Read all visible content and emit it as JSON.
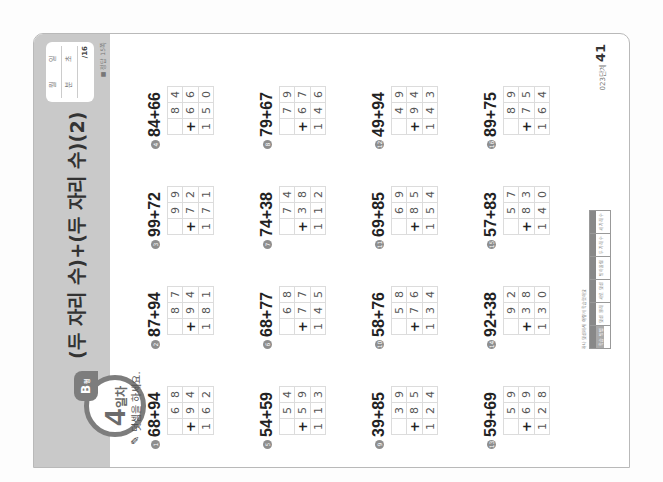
{
  "header": {
    "day_number": "4",
    "day_unit": "일차",
    "level_tab": "B",
    "level_tab_sub": "형",
    "title": "(두 자리 수)+(두 자리 수)(2)",
    "date_box": {
      "month_label": "월",
      "day_label": "일",
      "minute_label": "분",
      "second_label": "초",
      "score": "/16"
    },
    "answer_ref": "■ 정답 15쪽"
  },
  "instruction": "덧셈을 하세요.",
  "problems": [
    {
      "num": "1",
      "expr": "68+94",
      "a": [
        "",
        "6",
        "8"
      ],
      "b": [
        "+",
        "9",
        "4"
      ],
      "sum": [
        "1",
        "6",
        "2"
      ]
    },
    {
      "num": "2",
      "expr": "87+94",
      "a": [
        "",
        "8",
        "7"
      ],
      "b": [
        "+",
        "9",
        "4"
      ],
      "sum": [
        "1",
        "8",
        "1"
      ]
    },
    {
      "num": "3",
      "expr": "99+72",
      "a": [
        "",
        "9",
        "9"
      ],
      "b": [
        "+",
        "7",
        "2"
      ],
      "sum": [
        "1",
        "7",
        "1"
      ]
    },
    {
      "num": "4",
      "expr": "84+66",
      "a": [
        "",
        "8",
        "4"
      ],
      "b": [
        "+",
        "6",
        "6"
      ],
      "sum": [
        "1",
        "5",
        "0"
      ]
    },
    {
      "num": "5",
      "expr": "54+59",
      "a": [
        "",
        "5",
        "4"
      ],
      "b": [
        "+",
        "5",
        "9"
      ],
      "sum": [
        "1",
        "1",
        "3"
      ]
    },
    {
      "num": "6",
      "expr": "68+77",
      "a": [
        "",
        "6",
        "8"
      ],
      "b": [
        "+",
        "7",
        "7"
      ],
      "sum": [
        "1",
        "4",
        "5"
      ]
    },
    {
      "num": "7",
      "expr": "74+38",
      "a": [
        "",
        "7",
        "4"
      ],
      "b": [
        "+",
        "3",
        "8"
      ],
      "sum": [
        "1",
        "1",
        "2"
      ]
    },
    {
      "num": "8",
      "expr": "79+67",
      "a": [
        "",
        "7",
        "9"
      ],
      "b": [
        "+",
        "6",
        "7"
      ],
      "sum": [
        "1",
        "4",
        "6"
      ]
    },
    {
      "num": "9",
      "expr": "39+85",
      "a": [
        "",
        "3",
        "9"
      ],
      "b": [
        "+",
        "8",
        "5"
      ],
      "sum": [
        "1",
        "2",
        "4"
      ]
    },
    {
      "num": "10",
      "expr": "58+76",
      "a": [
        "",
        "5",
        "8"
      ],
      "b": [
        "+",
        "7",
        "6"
      ],
      "sum": [
        "1",
        "3",
        "4"
      ]
    },
    {
      "num": "11",
      "expr": "69+85",
      "a": [
        "",
        "6",
        "9"
      ],
      "b": [
        "+",
        "8",
        "5"
      ],
      "sum": [
        "1",
        "5",
        "4"
      ]
    },
    {
      "num": "12",
      "expr": "49+94",
      "a": [
        "",
        "4",
        "9"
      ],
      "b": [
        "+",
        "9",
        "4"
      ],
      "sum": [
        "1",
        "4",
        "3"
      ]
    },
    {
      "num": "13",
      "expr": "59+69",
      "a": [
        "",
        "5",
        "9"
      ],
      "b": [
        "+",
        "6",
        "9"
      ],
      "sum": [
        "1",
        "2",
        "8"
      ]
    },
    {
      "num": "14",
      "expr": "92+38",
      "a": [
        "",
        "9",
        "2"
      ],
      "b": [
        "+",
        "3",
        "8"
      ],
      "sum": [
        "1",
        "3",
        "0"
      ]
    },
    {
      "num": "15",
      "expr": "57+83",
      "a": [
        "",
        "5",
        "7"
      ],
      "b": [
        "+",
        "8",
        "3"
      ],
      "sum": [
        "1",
        "4",
        "0"
      ]
    },
    {
      "num": "16",
      "expr": "89+75",
      "a": [
        "",
        "8",
        "9"
      ],
      "b": [
        "+",
        "7",
        "5"
      ],
      "sum": [
        "1",
        "6",
        "4"
      ]
    }
  ],
  "footer": {
    "progress_label": "하나 덧셈에서 이렇게 학습했어요",
    "progress_steps": [
      "덧셈 원리",
      "세로 덧셈",
      "받아올림",
      "두 자리 수",
      "세 자리 수"
    ],
    "progress_active": "학습 방법",
    "book_code": "023단계",
    "page_number": "41"
  }
}
